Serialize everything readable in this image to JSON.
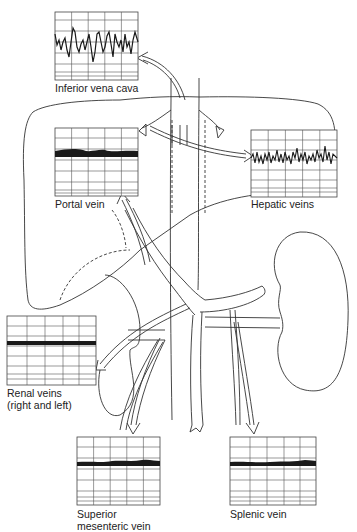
{
  "diagram": {
    "panels": [
      {
        "id": "ivc",
        "label": "Inferior vena cava",
        "waveform": "pulsatile-phasic"
      },
      {
        "id": "portal",
        "label": "Portal vein",
        "waveform": "continuous-flat"
      },
      {
        "id": "hepatic",
        "label": "Hepatic veins",
        "waveform": "pulsatile-phasic"
      },
      {
        "id": "renal",
        "label_line1": "Renal veins",
        "label_line2": "(right and left)",
        "waveform": "continuous-flat"
      },
      {
        "id": "smv",
        "label_line1": "Superior",
        "label_line2": "mesenteric vein",
        "waveform": "continuous-flat"
      },
      {
        "id": "splenic",
        "label": "Splenic vein",
        "waveform": "continuous-flat"
      }
    ],
    "anatomy": [
      "liver",
      "inferior-vena-cava",
      "hepatic-veins",
      "portal-vein",
      "splenic-vein",
      "superior-mesenteric-vein",
      "renal-veins",
      "right-kidney",
      "left-kidney"
    ],
    "colors": {
      "line": "#333333",
      "grid": "#555555",
      "trace": "#1a1a1a",
      "background": "#ffffff"
    }
  }
}
